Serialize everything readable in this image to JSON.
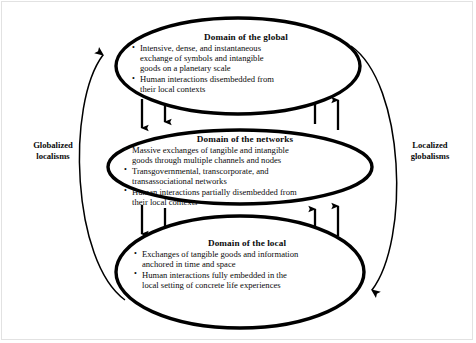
{
  "diagram": {
    "title_hidden": "",
    "ellipses": [
      {
        "id": "global",
        "title": "Domain of the global",
        "bullets": [
          [
            "Intensive, dense, and instantaneous",
            "exchange of symbols and intangible",
            "goods on a planetary scale"
          ],
          [
            "Human interactions disembedded from",
            "their local contexts"
          ]
        ]
      },
      {
        "id": "networks",
        "title": "Domain of the networks",
        "bullets": [
          [
            "Massive exchanges of tangible and intangible",
            "goods through multiple channels and nodes"
          ],
          [
            "Transgovernmental, transcorporate, and",
            "transassociational networks"
          ],
          [
            "Human interactions partially disembedded from",
            "their local contexts"
          ]
        ]
      },
      {
        "id": "local",
        "title": "Domain of the local",
        "bullets": [
          [
            "Exchanges of tangible goods and information",
            "anchored in time and space"
          ],
          [
            "Human interactions fully embedded in the",
            "local setting of concrete life experiences"
          ]
        ]
      }
    ],
    "side_labels": {
      "left": "Globalized\nlocalisms",
      "left_line1": "Globalized",
      "left_line2": "localisms",
      "right": "Localized\nglobalisms",
      "right_line1": "Localized",
      "right_line2": "globalisms"
    },
    "colors": {
      "stroke": "#000000",
      "text": "#0b0b0b",
      "background": "#ffffff",
      "frame": "#e2e2e2"
    }
  }
}
